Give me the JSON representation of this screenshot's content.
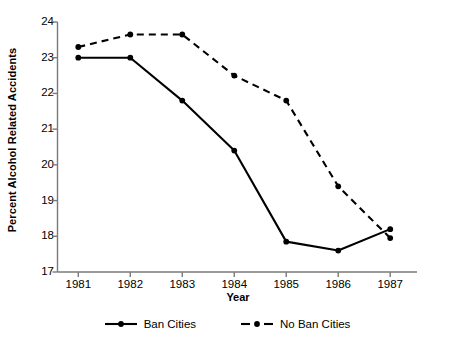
{
  "chart_data": {
    "type": "line",
    "title": "",
    "xlabel": "Year",
    "ylabel": "Percent Alcohol Related Accidents",
    "categories": [
      "1981",
      "1982",
      "1983",
      "1984",
      "1985",
      "1986",
      "1987"
    ],
    "x": [
      1981,
      1982,
      1983,
      1984,
      1985,
      1986,
      1987
    ],
    "xlim": [
      1980.6,
      1987.4
    ],
    "ylim": [
      17,
      24
    ],
    "yticks": [
      17,
      18,
      19,
      20,
      21,
      22,
      23,
      24
    ],
    "ytick_labels": [
      "17",
      "18",
      "19",
      "20",
      "21",
      "22",
      "23",
      "24"
    ],
    "xticks": [
      1981,
      1982,
      1983,
      1984,
      1985,
      1986,
      1987
    ],
    "xtick_labels": [
      "1981",
      "1982",
      "1983",
      "1984",
      "1985",
      "1986",
      "1987"
    ],
    "grid": false,
    "legend_position": "bottom",
    "series": [
      {
        "name": "Ban Cities",
        "style": "solid",
        "marker": "circle",
        "color": "#000000",
        "values": [
          23.0,
          23.0,
          21.8,
          20.4,
          17.85,
          17.6,
          18.2
        ]
      },
      {
        "name": "No Ban Cities",
        "style": "dashed",
        "marker": "circle",
        "color": "#000000",
        "values": [
          23.3,
          23.65,
          23.65,
          22.5,
          21.8,
          19.4,
          17.95
        ]
      }
    ]
  },
  "legend": {
    "items": [
      {
        "label": "Ban Cities"
      },
      {
        "label": "No Ban Cities"
      }
    ]
  }
}
